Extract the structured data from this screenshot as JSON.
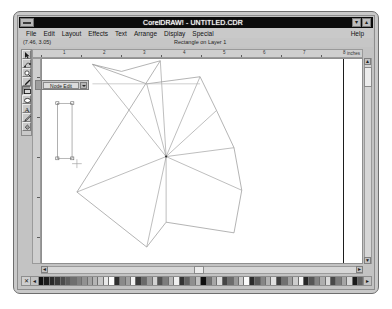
{
  "window": {
    "title": "CorelDRAW! - UNTITLED.CDR",
    "minimize_label": "▾",
    "maximize_label": "▴",
    "system_menu_name": "system-menu-box"
  },
  "menubar": {
    "items": [
      {
        "label": "File"
      },
      {
        "label": "Edit"
      },
      {
        "label": "Layout"
      },
      {
        "label": "Effects"
      },
      {
        "label": "Text"
      },
      {
        "label": "Arrange"
      },
      {
        "label": "Display"
      },
      {
        "label": "Special"
      }
    ],
    "help_label": "Help"
  },
  "statusbar": {
    "coordinates": "(7.46, 3.05)",
    "object_info": "Rectangle on Layer 1"
  },
  "toolbox": {
    "tools": [
      {
        "name": "pick-tool",
        "icon": "arrow-icon",
        "active": false
      },
      {
        "name": "shape-tool",
        "icon": "node-edit-icon",
        "active": false
      },
      {
        "name": "zoom-tool",
        "icon": "magnifier-icon",
        "active": false
      },
      {
        "name": "pencil-tool",
        "icon": "pencil-icon",
        "active": false
      },
      {
        "name": "rectangle-tool",
        "icon": "rectangle-icon",
        "active": true
      },
      {
        "name": "ellipse-tool",
        "icon": "ellipse-icon",
        "active": false
      },
      {
        "name": "text-tool",
        "icon": "text-a-icon",
        "active": false
      },
      {
        "name": "outline-tool",
        "icon": "pen-nib-icon",
        "active": false
      },
      {
        "name": "fill-tool",
        "icon": "paint-bucket-icon",
        "active": false
      }
    ]
  },
  "rollup": {
    "field_value": "Node Edit",
    "dropdown_icon": "chevron-down-icon"
  },
  "rulers": {
    "unit_label": "inches",
    "h_ticks": [
      "1",
      "2",
      "3",
      "4",
      "5",
      "6",
      "7",
      "8"
    ],
    "v_ticks": [
      "1",
      "2",
      "3",
      "4",
      "5",
      "6"
    ]
  },
  "scrollbars": {
    "up_arrow": "▲",
    "down_arrow": "▼",
    "left_arrow": "◄",
    "right_arrow": "►"
  },
  "palette": {
    "no_fill_label": "✕",
    "scroll_left_label": "◄",
    "scroll_right_label": "►",
    "swatches": [
      "#111111",
      "#1c1c1c",
      "#2a2a2a",
      "#3a3a3a",
      "#4c4c4c",
      "#5e5e5e",
      "#6f6f6f",
      "#808080",
      "#919191",
      "#a3a3a3",
      "#b4b4b4",
      "#c6c6c6",
      "#e8e8e8",
      "#fdfdfd",
      "#2f2f2f",
      "#8a8a8a",
      "#a0a0a0",
      "#f2f2f2",
      "#3c3c3c",
      "#6a6a6a",
      "#9b9b9b",
      "#d2d2d2",
      "#525252",
      "#7d7d7d",
      "#b9b9b9",
      "#efefef",
      "#343434",
      "#636363",
      "#8f8f8f",
      "#c0c0c0",
      "#0f0f0f",
      "#747474",
      "#a7a7a7",
      "#dcdcdc",
      "#454545",
      "#6c6c6c",
      "#989898",
      "#cbcbcb",
      "#fafafa",
      "#2b2b2b",
      "#5a5a5a",
      "#868686",
      "#b2b2b2",
      "#e0e0e0",
      "#3f3f3f",
      "#717171",
      "#9f9f9f",
      "#cdcdcd",
      "#f6f6f6",
      "#262626",
      "#565656",
      "#838383",
      "#aeaeae",
      "#dadada",
      "#484848",
      "#7a7a7a",
      "#a5a5a5",
      "#d6d6d6",
      "#1a1a1a",
      "#606060"
    ]
  },
  "drawing": {
    "stroke_color": "#8a8a8a",
    "selection_stroke": "#9a9a9a",
    "description": "star-polygon-with-radiating-spokes",
    "center": {
      "x": 128,
      "y": 110
    },
    "polygon_points": "122,2 82,14 52,6 108,28 163,20 180,58 198,100 128,110 206,148 198,196 128,184 108,212 36,150",
    "spokes": [
      {
        "x": 122,
        "y": 2
      },
      {
        "x": 52,
        "y": 6
      },
      {
        "x": 108,
        "y": 28
      },
      {
        "x": 163,
        "y": 20
      },
      {
        "x": 198,
        "y": 100
      },
      {
        "x": 206,
        "y": 148
      },
      {
        "x": 128,
        "y": 184
      },
      {
        "x": 108,
        "y": 212
      },
      {
        "x": 36,
        "y": 150
      }
    ],
    "selected_rect": {
      "x": 16,
      "y": 50,
      "w": 15,
      "h": 62
    },
    "cursor": {
      "x": 36,
      "y": 116
    }
  }
}
